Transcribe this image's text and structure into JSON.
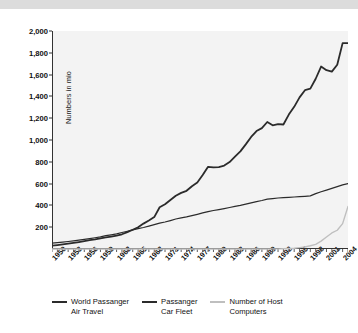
{
  "chart_data": {
    "type": "line",
    "title": "",
    "xlabel": "",
    "ylabel": "Numbers in mio",
    "xlim": [
      1950,
      2005
    ],
    "ylim": [
      0,
      2000
    ],
    "ytick_values": [
      200,
      400,
      600,
      800,
      1000,
      1200,
      1400,
      1600,
      1800,
      2000
    ],
    "ytick_labels": [
      "200",
      "400",
      "600",
      "800",
      "1,000",
      "1,200",
      "1,400",
      "1,600",
      "1,800",
      "2,000"
    ],
    "xtick_values": [
      1950,
      1953,
      1956,
      1959,
      1962,
      1965,
      1968,
      1971,
      1974,
      1977,
      1980,
      1983,
      1986,
      1989,
      1992,
      1995,
      1998,
      2001,
      2004
    ],
    "xtick_labels": [
      "1950",
      "1953",
      "1956",
      "1959",
      "1962",
      "1965",
      "1968",
      "1971",
      "1974",
      "1977",
      "1980",
      "1983",
      "1986",
      "1989",
      "1992",
      "1995",
      "1998",
      "2001",
      "2004"
    ],
    "minor_xticks_every": 1,
    "grid": false,
    "legend_position": "bottom",
    "x": [
      1950,
      1951,
      1952,
      1953,
      1954,
      1955,
      1956,
      1957,
      1958,
      1959,
      1960,
      1961,
      1962,
      1963,
      1964,
      1965,
      1966,
      1967,
      1968,
      1969,
      1970,
      1971,
      1972,
      1973,
      1974,
      1975,
      1976,
      1977,
      1978,
      1979,
      1980,
      1981,
      1982,
      1983,
      1984,
      1985,
      1986,
      1987,
      1988,
      1989,
      1990,
      1991,
      1992,
      1993,
      1994,
      1995,
      1996,
      1997,
      1998,
      1999,
      2000,
      2001,
      2002,
      2003,
      2004,
      2005
    ],
    "series": [
      {
        "name": "World Passanger Air Travel",
        "color": "#2b2b2b",
        "width": 1.8,
        "values": [
          31,
          36,
          42,
          49,
          56,
          64,
          73,
          82,
          88,
          97,
          106,
          114,
          123,
          135,
          155,
          177,
          200,
          233,
          262,
          293,
          383,
          411,
          450,
          489,
          515,
          534,
          576,
          610,
          679,
          754,
          748,
          752,
          766,
          798,
          848,
          896,
          960,
          1028,
          1082,
          1109,
          1165,
          1135,
          1146,
          1142,
          1233,
          1304,
          1391,
          1457,
          1471,
          1562,
          1674,
          1640,
          1627,
          1691,
          1889,
          1889
        ]
      },
      {
        "name": "Passanger Car Fleet",
        "color": "#2b2b2b",
        "width": 1.2,
        "values": [
          53,
          58,
          63,
          69,
          75,
          82,
          89,
          96,
          103,
          111,
          122,
          130,
          139,
          151,
          163,
          175,
          187,
          197,
          210,
          223,
          237,
          248,
          261,
          275,
          285,
          294,
          306,
          318,
          331,
          343,
          353,
          362,
          371,
          381,
          391,
          400,
          411,
          423,
          435,
          445,
          457,
          463,
          468,
          471,
          474,
          477,
          480,
          483,
          487,
          508,
          525,
          540,
          556,
          572,
          588,
          600
        ]
      },
      {
        "name": "Number of Host Computers",
        "color": "#bfbfbf",
        "width": 1.4,
        "values": [
          0,
          0,
          0,
          0,
          0,
          0,
          0,
          0,
          0,
          0,
          0,
          0,
          0,
          0,
          0,
          0,
          0,
          0,
          0,
          0,
          0,
          0,
          0,
          0,
          0,
          0,
          0,
          0,
          0,
          0,
          0,
          0,
          0,
          0,
          0,
          0,
          0,
          0,
          0,
          0,
          0,
          1,
          1,
          2,
          4,
          7,
          13,
          20,
          30,
          43,
          72,
          110,
          147,
          172,
          233,
          390
        ]
      }
    ]
  },
  "legend": {
    "items": [
      {
        "label": "World Passanger\nAir Travel",
        "color": "#2b2b2b"
      },
      {
        "label": "Passanger\nCar Fleet",
        "color": "#2b2b2b"
      },
      {
        "label": "Number of Host\nComputers",
        "color": "#bfbfbf"
      }
    ]
  },
  "axis": {
    "y_title": "Numbers in mio"
  },
  "colors": {
    "plot_background": "#f3f3f3",
    "page_background": "#ffffff",
    "top_band": "#dcdcdc",
    "axis_line": "#333333",
    "text": "#111111"
  }
}
